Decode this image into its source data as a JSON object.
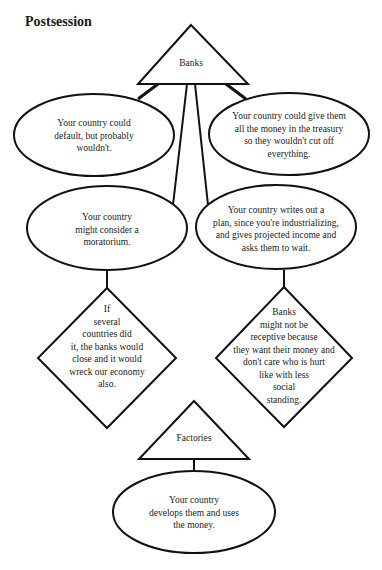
{
  "title": "Postsession",
  "nodes": {
    "banks": {
      "shape": "triangle",
      "label": "Banks"
    },
    "default": {
      "shape": "ellipse",
      "label": "Your country could\ndefault, but probably\nwouldn't."
    },
    "give_money": {
      "shape": "ellipse",
      "label": "Your country could give them\nall the money in the treasury\nso they wouldn't cut off\neverything."
    },
    "moratorium": {
      "shape": "ellipse",
      "label": "Your country\nmight consider a\nmoratorium."
    },
    "plan": {
      "shape": "ellipse",
      "label": "Your country writes out a\nplan, since you're industrializing,\nand gives projected income and\nasks them to wait."
    },
    "several_countries": {
      "shape": "diamond",
      "label": "If\nseveral\ncountries did\nit, the banks would\nclose and it would\nwreck our economy\nalso."
    },
    "not_receptive": {
      "shape": "diamond",
      "label": "Banks\nmight not be\nreceptive because\nthey want their money and\ndon't care who is hurt\nlike with less\nsocial\nstanding."
    },
    "factories": {
      "shape": "triangle",
      "label": "Factories"
    },
    "develops": {
      "shape": "ellipse",
      "label": "Your country\ndevelops them and uses\nthe money."
    }
  },
  "edges": [
    [
      "banks",
      "default"
    ],
    [
      "banks",
      "give_money"
    ],
    [
      "banks",
      "moratorium"
    ],
    [
      "banks",
      "plan"
    ],
    [
      "moratorium",
      "several_countries"
    ],
    [
      "plan",
      "not_receptive"
    ],
    [
      "factories",
      "develops"
    ]
  ]
}
